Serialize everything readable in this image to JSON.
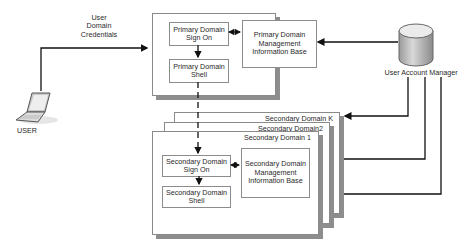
{
  "diagram": {
    "user": {
      "label": "USER",
      "icon": "laptop-icon"
    },
    "credentials_label": [
      "User",
      "Domain",
      "Credentials"
    ],
    "user_account_manager": {
      "label": "User Account Manager",
      "icon": "database-icon"
    },
    "primary_domain": {
      "sign_on": "Primary Domain Sign On",
      "shell": "Primary Domain Shell",
      "mib": "Primary Domain Management Information Base"
    },
    "secondary_domains": [
      {
        "title": "Secondary Domain K"
      },
      {
        "title": "Secondary Domain2"
      },
      {
        "title": "Secondary Domain 1",
        "sign_on": "Secondary Domain Sign On",
        "shell": "Secondary Domain Shell",
        "mib": "Secondary Domain Management Information Base"
      }
    ]
  }
}
